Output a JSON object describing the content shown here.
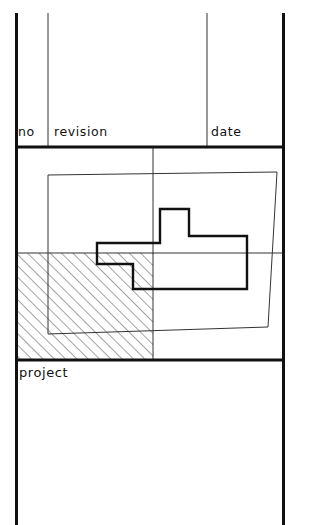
{
  "sheet": {
    "width": 309,
    "height": 525,
    "background_color": "#ffffff",
    "line_color": "#111111",
    "hatch_color": "#555555"
  },
  "revision_table": {
    "columns": [
      {
        "key": "no",
        "label": "no"
      },
      {
        "key": "revision",
        "label": "revision"
      },
      {
        "key": "date",
        "label": "date"
      }
    ],
    "rows": []
  },
  "title_block": {
    "project_label": "project",
    "project_value": ""
  },
  "geometry": {
    "frame": {
      "left": 15,
      "right": 285,
      "top": 13,
      "bottom": 525,
      "stroke_width": 3
    },
    "rules": [
      {
        "name": "revision-header-baseline",
        "x1": 15,
        "y1": 147,
        "x2": 285,
        "y2": 147,
        "stroke_width": 3
      },
      {
        "name": "drawing-area-bottom",
        "x1": 15,
        "y1": 360,
        "x2": 285,
        "y2": 360,
        "stroke_width": 3
      },
      {
        "name": "mid-horizontal-rule",
        "x1": 15,
        "y1": 253,
        "x2": 285,
        "y2": 253,
        "stroke_width": 1
      },
      {
        "name": "column-divider-no",
        "x1": 48,
        "y1": 13,
        "x2": 48,
        "y2": 147,
        "stroke_width": 1
      },
      {
        "name": "column-divider-date",
        "x1": 207,
        "y1": 13,
        "x2": 207,
        "y2": 147,
        "stroke_width": 1
      },
      {
        "name": "drawing-area-divider",
        "x1": 153,
        "y1": 147,
        "x2": 153,
        "y2": 360,
        "stroke_width": 1
      }
    ],
    "hatched_region": {
      "name": "hatched-area",
      "x": 15,
      "y": 253,
      "width": 138,
      "height": 107,
      "hatch_angle_deg": 45,
      "hatch_spacing": 8
    },
    "thin_quadrilateral": {
      "name": "thin-outline-quad",
      "points": "48,175 277,172 268,327 48,334",
      "stroke_width": 1
    },
    "thick_polygon": {
      "name": "thick-outline-shape",
      "points": "97,243 97,264 133,264 133,289 247,289 247,236 189,236 189,209 160,209 160,243",
      "stroke_width": 2.4
    }
  }
}
